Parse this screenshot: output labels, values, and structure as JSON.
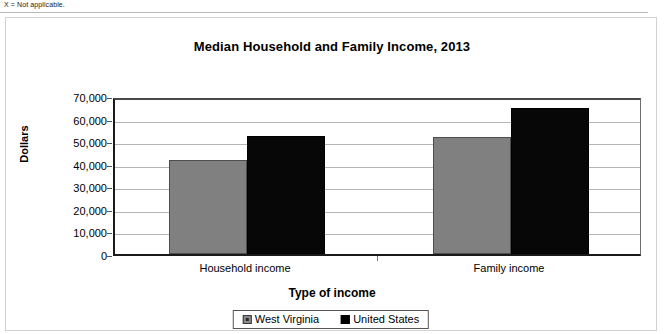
{
  "page": {
    "footnote": "X = Not applicable."
  },
  "chart_data": {
    "type": "bar",
    "title": "Median Household and Family Income, 2013",
    "xlabel": "Type of income",
    "ylabel": "Dollars",
    "categories": [
      "Household income",
      "Family income"
    ],
    "series": [
      {
        "name": "West Virginia",
        "color": "#808080",
        "values": [
          41500,
          51700
        ]
      },
      {
        "name": "United States",
        "color": "#000000",
        "values": [
          52250,
          64500
        ]
      }
    ],
    "ylim": [
      0,
      70000
    ],
    "ytick_values": [
      70000,
      60000,
      50000,
      40000,
      30000,
      20000,
      10000,
      0
    ],
    "ytick_labels": [
      "70,000",
      "60,000",
      "50,000",
      "40,000",
      "30,000",
      "20,000",
      "10,000",
      "0"
    ],
    "grid": true,
    "legend_position": "bottom"
  }
}
